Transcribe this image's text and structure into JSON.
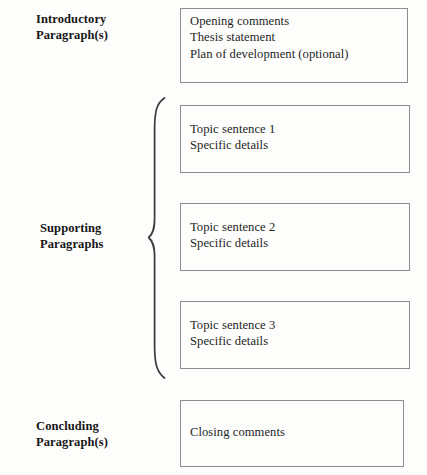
{
  "diagram": {
    "background_color": "#fdfdfc",
    "border_color": "#8d8d8d",
    "text_color": "#1f1f1f",
    "sections": [
      {
        "id": "introductory",
        "label": "Introductory\nParagraph(s)",
        "box_text": "Opening comments\nThesis statement\nPlan of development (optional)",
        "lines": [
          "Opening comments",
          "Thesis statement",
          "Plan of development (optional)"
        ]
      },
      {
        "id": "supporting",
        "label": "Supporting\nParagraphs",
        "grouped_by_brace": true,
        "boxes": [
          {
            "id": "supporting-1",
            "box_text": "Topic sentence 1\nSpecific details",
            "lines": [
              "Topic sentence 1",
              "Specific details"
            ]
          },
          {
            "id": "supporting-2",
            "box_text": "Topic sentence 2\nSpecific details",
            "lines": [
              "Topic sentence 2",
              "Specific details"
            ]
          },
          {
            "id": "supporting-3",
            "box_text": "Topic sentence 3\nSpecific details",
            "lines": [
              "Topic sentence 3",
              "Specific details"
            ]
          }
        ]
      },
      {
        "id": "concluding",
        "label": "Concluding\nParagraph(s)",
        "box_text": "Closing comments",
        "lines": [
          "Closing comments"
        ]
      }
    ]
  }
}
